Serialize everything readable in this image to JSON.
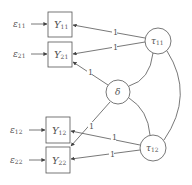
{
  "diagram": {
    "errors": [
      {
        "label": "ε",
        "sub": "11"
      },
      {
        "label": "ε",
        "sub": "21"
      },
      {
        "label": "ε",
        "sub": "12"
      },
      {
        "label": "ε",
        "sub": "22"
      }
    ],
    "observed": [
      {
        "label": "Y",
        "sub": "11"
      },
      {
        "label": "Y",
        "sub": "21"
      },
      {
        "label": "Y",
        "sub": "12"
      },
      {
        "label": "Y",
        "sub": "22"
      }
    ],
    "latent": [
      {
        "label": "τ",
        "sub": "11"
      },
      {
        "label": "δ",
        "sub": ""
      },
      {
        "label": "τ",
        "sub": "12"
      }
    ],
    "loadings": [
      "1",
      "1",
      "1",
      "1",
      "1",
      "1"
    ]
  }
}
